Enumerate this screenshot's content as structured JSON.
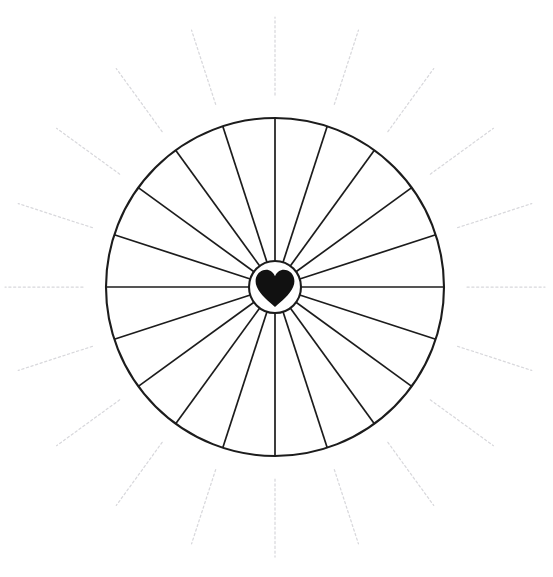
{
  "artwork": {
    "title": "Sunburst Wheel With Heart Center",
    "description": "Black-and-white line drawing of a large circle divided into twenty equal pie sectors by straight spokes, with a small circular hub at the center containing a solid filled heart, surrounded by twenty faint dashed rays radiating outward beyond the rim.",
    "style": "line-art",
    "background_color": "#ffffff",
    "line_color": "#1c1c1c",
    "ray_color": "#d8d8dc",
    "heart_color": "#111111"
  },
  "canvas": {
    "width": 553,
    "height": 577
  },
  "chart_data": {
    "type": "pie",
    "center_x": 275,
    "center_y": 287,
    "outer_radius": 169,
    "hub_radius": 26,
    "sector_count": 20,
    "sector_angle_degrees": 18,
    "categories": [
      "sector-01",
      "sector-02",
      "sector-03",
      "sector-04",
      "sector-05",
      "sector-06",
      "sector-07",
      "sector-08",
      "sector-09",
      "sector-10",
      "sector-11",
      "sector-12",
      "sector-13",
      "sector-14",
      "sector-15",
      "sector-16",
      "sector-17",
      "sector-18",
      "sector-19",
      "sector-20"
    ],
    "values": [
      18,
      18,
      18,
      18,
      18,
      18,
      18,
      18,
      18,
      18,
      18,
      18,
      18,
      18,
      18,
      18,
      18,
      18,
      18,
      18
    ],
    "spoke_angles_degrees": [
      0,
      18,
      36,
      54,
      72,
      90,
      108,
      126,
      144,
      162,
      180,
      198,
      216,
      234,
      252,
      270,
      288,
      306,
      324,
      342
    ],
    "legend": [],
    "grid": false,
    "xlabel": "",
    "ylabel": ""
  },
  "rays": {
    "count": 20,
    "angles_degrees": [
      90,
      108,
      126,
      144,
      162,
      198,
      216,
      234,
      252,
      270,
      288,
      306,
      324,
      342,
      18,
      36,
      54,
      72,
      0,
      180
    ],
    "inner_radius": 192,
    "outer_radius": 270,
    "dash_pattern": "2.2 2.6",
    "stroke_width": 1.25
  },
  "hub": {
    "label": "heart-hub",
    "radius": 26,
    "fill": "#ffffff",
    "stroke": "#1c1c1c"
  },
  "heart": {
    "label": "heart",
    "width": 40,
    "height": 38,
    "fill": "#111111"
  }
}
